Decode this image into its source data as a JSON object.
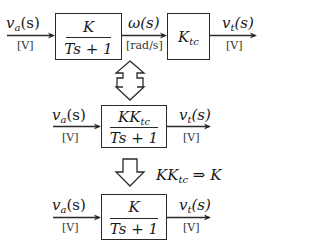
{
  "row1": {
    "input": {
      "label_main": "v",
      "label_sub": "a",
      "label_tail": "(s)",
      "unit": "[V]"
    },
    "block1": {
      "numerator": "K",
      "denominator": "Ts + 1"
    },
    "mid": {
      "label": "ω(s)",
      "unit": "[rad/s]"
    },
    "block2": {
      "main": "K",
      "sub": "tc"
    },
    "output": {
      "label_main": "v",
      "label_sub": "t",
      "label_tail": "(s)",
      "unit": "[V]"
    }
  },
  "row2": {
    "input": {
      "label_main": "v",
      "label_sub": "a",
      "label_tail": "(s)",
      "unit": "[V]"
    },
    "block": {
      "numerator_main": "KK",
      "numerator_sub": "tc",
      "denominator": "Ts + 1"
    },
    "output": {
      "label_main": "v",
      "label_sub": "t",
      "label_tail": "(s)",
      "unit": "[V]"
    }
  },
  "transform": {
    "lhs_main": "KK",
    "lhs_sub": "tc",
    "rhs": " ⇒ K"
  },
  "row3": {
    "input": {
      "label_main": "v",
      "label_sub": "a",
      "label_tail": "(s)",
      "unit": "[V]"
    },
    "block": {
      "numerator": "K",
      "denominator": "Ts + 1"
    },
    "output": {
      "label_main": "v",
      "label_sub": "t",
      "label_tail": "(s)",
      "unit": "[V]"
    }
  },
  "arrows": {
    "equivalence": "double-headed-hollow-arrow",
    "simplify": "down-hollow-arrow"
  }
}
